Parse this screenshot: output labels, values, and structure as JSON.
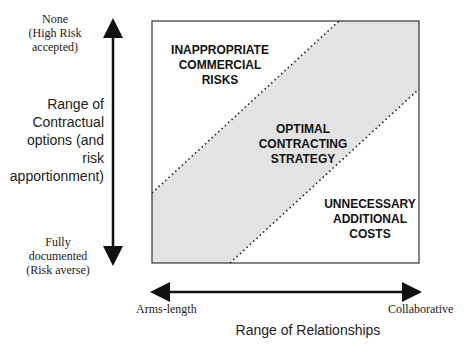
{
  "y_axis": {
    "top_label": [
      "None",
      "(High Risk",
      "accepted)"
    ],
    "title": [
      "Range of",
      "Contractual",
      "options (and risk",
      "apportionment)"
    ],
    "bottom_label": [
      "Fully",
      "documented",
      "(Risk averse)"
    ]
  },
  "x_axis": {
    "left_label": "Arms-length",
    "right_label": "Collaborative",
    "title": "Range of Relationships"
  },
  "regions": {
    "top_left": [
      "INAPPROPRIATE",
      "COMMERCIAL",
      "RISKS"
    ],
    "middle": [
      "OPTIMAL",
      "CONTRACTING",
      "STRATEGY"
    ],
    "bottom_right": [
      "UNNECESSARY",
      "ADDITIONAL",
      "COSTS"
    ]
  },
  "colors": {
    "band_fill": "#e3e3e3",
    "frame": "#333333",
    "arrow": "#111111"
  }
}
